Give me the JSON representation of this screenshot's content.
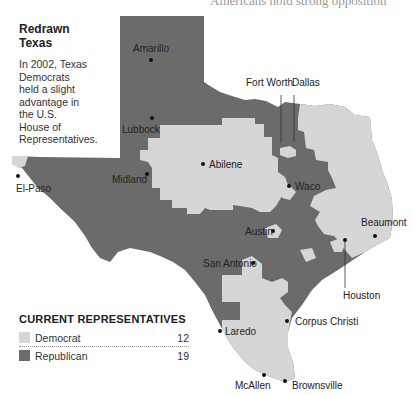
{
  "header": {
    "cut_off_text": "Americans hold strong opposition"
  },
  "intro": {
    "title_line1": "Redrawn",
    "title_line2": "Texas",
    "body": "In 2002, Texas Democrats held a slight advantage in the U.S. House of Representatives."
  },
  "colors": {
    "democrat": "#d6d6d6",
    "republican": "#6b6b6b"
  },
  "cities": [
    {
      "name": "Amarillo",
      "x": 151,
      "y": 60
    },
    {
      "name": "Lubbock",
      "x": 152,
      "y": 118
    },
    {
      "name": "Midland",
      "x": 147,
      "y": 174
    },
    {
      "name": "El-Paso",
      "x": 18,
      "y": 176
    },
    {
      "name": "Abilene",
      "x": 203,
      "y": 164
    },
    {
      "name": "Fort Worth",
      "x": 281,
      "y": 143
    },
    {
      "name": "Dallas",
      "x": 294,
      "y": 142
    },
    {
      "name": "Waco",
      "x": 289,
      "y": 186
    },
    {
      "name": "Austin",
      "x": 273,
      "y": 231
    },
    {
      "name": "Beaumont",
      "x": 375,
      "y": 236
    },
    {
      "name": "San Antonio",
      "x": 253,
      "y": 263
    },
    {
      "name": "Houston",
      "x": 345,
      "y": 240
    },
    {
      "name": "Corpus Christi",
      "x": 287,
      "y": 321
    },
    {
      "name": "Laredo",
      "x": 220,
      "y": 331
    },
    {
      "name": "McAllen",
      "x": 264,
      "y": 375
    },
    {
      "name": "Brownsville",
      "x": 285,
      "y": 381
    }
  ],
  "legend": {
    "title": "CURRENT REPRESENTATIVES",
    "items": [
      {
        "label": "Democrat",
        "count": "12",
        "color": "#d6d6d6"
      },
      {
        "label": "Republican",
        "count": "19",
        "color": "#6b6b6b"
      }
    ]
  }
}
